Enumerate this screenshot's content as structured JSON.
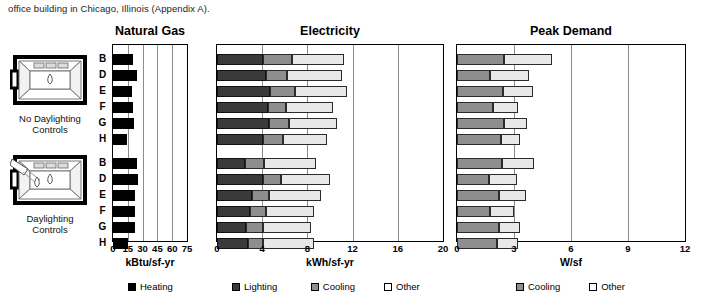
{
  "caption": "office building in Chicago, Illinois (Appendix A).",
  "panels": {
    "gas": {
      "title": "Natural Gas",
      "unit": "kBtu/sf-yr"
    },
    "elec": {
      "title": "Electricity",
      "unit": "kWh/sf-yr"
    },
    "peak": {
      "title": "Peak Demand",
      "unit": "W/sf"
    }
  },
  "groups": [
    {
      "id": "no-daylighting",
      "caption_line1": "No Daylighting",
      "caption_line2": "Controls",
      "icon": "room-no-daylighting-icon"
    },
    {
      "id": "daylighting",
      "caption_line1": "Daylighting",
      "caption_line2": "Controls",
      "icon": "room-daylighting-icon"
    }
  ],
  "row_labels": [
    "B",
    "D",
    "E",
    "F",
    "G",
    "H"
  ],
  "legend": [
    {
      "key": "heating",
      "label": "Heating",
      "color": "#000000"
    },
    {
      "key": "lighting",
      "label": "Lighting",
      "color": "#3a3a3a"
    },
    {
      "key": "cooling",
      "label": "Cooling",
      "color": "#8e8e8e"
    },
    {
      "key": "other",
      "label": "Other",
      "color": "#ffffff"
    }
  ],
  "chart_data": [
    {
      "type": "bar",
      "title": "Natural Gas",
      "orientation": "horizontal",
      "stacked": true,
      "xlabel": "kBtu/sf-yr",
      "ylabel": "",
      "xlim": [
        0,
        75
      ],
      "xticks": [
        0,
        15,
        30,
        45,
        60,
        75
      ],
      "grid": true,
      "legend_position": "bottom",
      "categories": [
        "B",
        "D",
        "E",
        "F",
        "G",
        "H"
      ],
      "groups": [
        {
          "name": "No Daylighting Controls",
          "series": [
            {
              "name": "Heating",
              "values": [
                20.0,
                24.5,
                19.0,
                20.0,
                21.0,
                14.0
              ]
            }
          ]
        },
        {
          "name": "Daylighting Controls",
          "series": [
            {
              "name": "Heating",
              "values": [
                24.5,
                25.5,
                22.0,
                22.5,
                22.5,
                15.5
              ]
            }
          ]
        }
      ]
    },
    {
      "type": "bar",
      "title": "Electricity",
      "orientation": "horizontal",
      "stacked": true,
      "xlabel": "kWh/sf-yr",
      "ylabel": "",
      "xlim": [
        0,
        20
      ],
      "xticks": [
        0,
        4,
        8,
        12,
        16,
        20
      ],
      "grid": true,
      "legend_position": "bottom",
      "categories": [
        "B",
        "D",
        "E",
        "F",
        "G",
        "H"
      ],
      "groups": [
        {
          "name": "No Daylighting Controls",
          "series": [
            {
              "name": "Lighting",
              "values": [
                4.1,
                4.3,
                4.7,
                4.5,
                4.6,
                4.1
              ]
            },
            {
              "name": "Cooling",
              "values": [
                2.5,
                1.9,
                2.2,
                1.6,
                1.8,
                1.7
              ]
            },
            {
              "name": "Other",
              "values": [
                4.6,
                4.9,
                4.6,
                4.2,
                4.2,
                3.9
              ]
            }
          ]
        },
        {
          "name": "Daylighting Controls",
          "series": [
            {
              "name": "Lighting",
              "values": [
                2.5,
                4.1,
                3.1,
                2.9,
                2.6,
                2.7
              ]
            },
            {
              "name": "Cooling",
              "values": [
                1.7,
                1.6,
                1.5,
                1.4,
                1.5,
                1.4
              ]
            },
            {
              "name": "Other",
              "values": [
                4.6,
                4.3,
                4.6,
                4.3,
                4.2,
                4.5
              ]
            }
          ]
        }
      ]
    },
    {
      "type": "bar",
      "title": "Peak Demand",
      "orientation": "horizontal",
      "stacked": true,
      "xlabel": "W/sf",
      "ylabel": "",
      "xlim": [
        0,
        12
      ],
      "xticks": [
        0,
        3,
        6,
        9,
        12
      ],
      "grid": true,
      "legend_position": "bottom",
      "categories": [
        "B",
        "D",
        "E",
        "F",
        "G",
        "H"
      ],
      "groups": [
        {
          "name": "No Daylighting Controls",
          "series": [
            {
              "name": "Cooling",
              "values": [
                2.45,
                1.75,
                2.4,
                1.9,
                2.45,
                2.3
              ]
            },
            {
              "name": "Other",
              "values": [
                2.55,
                2.05,
                1.6,
                1.3,
                1.25,
                1.0
              ]
            }
          ]
        },
        {
          "name": "Daylighting Controls",
          "series": [
            {
              "name": "Cooling",
              "values": [
                2.35,
                1.7,
                2.2,
                1.75,
                2.2,
                2.1
              ]
            },
            {
              "name": "Other",
              "values": [
                1.7,
                1.45,
                1.45,
                1.25,
                1.1,
                1.1
              ]
            }
          ]
        }
      ]
    }
  ]
}
